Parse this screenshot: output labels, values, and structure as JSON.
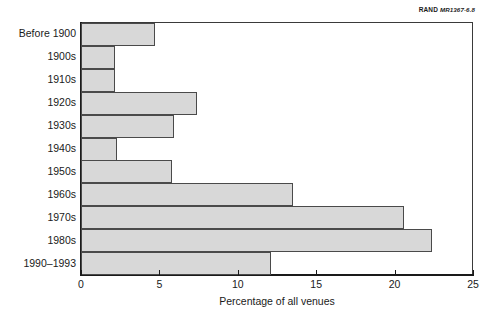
{
  "figure": {
    "source_tag": {
      "org": "RAND",
      "code": "MR1367-6.8"
    }
  },
  "chart_data": {
    "type": "bar",
    "orientation": "horizontal",
    "title": "",
    "subtitle": "",
    "xlabel": "Percentage of all venues",
    "ylabel": "",
    "categories": [
      "Before 1900",
      "1900s",
      "1910s",
      "1920s",
      "1930s",
      "1940s",
      "1950s",
      "1960s",
      "1970s",
      "1980s",
      "1990–1993"
    ],
    "values": [
      4.7,
      2.2,
      2.2,
      7.4,
      5.9,
      2.3,
      5.8,
      13.5,
      20.6,
      22.4,
      12.1
    ],
    "xlim": [
      0,
      25
    ],
    "xticks": [
      0,
      5,
      10,
      15,
      20,
      25
    ],
    "xtick_labels": [
      "0",
      "5",
      "10",
      "15",
      "20",
      "25"
    ],
    "grid": false,
    "legend": null,
    "bar_fill_color": "#d8d8d8",
    "bar_edge_color": "#4a4a4a",
    "axis_color": "#1a1a1a"
  }
}
